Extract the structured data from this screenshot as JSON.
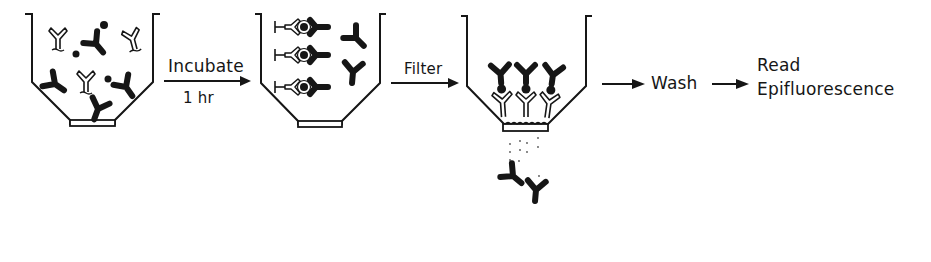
{
  "diagram": {
    "type": "process-flow",
    "colors": {
      "ink": "#161616",
      "background": "#ffffff"
    },
    "steps": [
      {
        "id": "funnel-1",
        "label": "",
        "contents": "free unlabeled antibodies, labeled antibodies, antigen particles"
      },
      {
        "id": "arrow-incubate",
        "label_top": "Incubate",
        "label_bottom": "1 hr"
      },
      {
        "id": "funnel-2",
        "label": "",
        "contents": "antigen-antibody sandwich complexes plus free labeled antibodies"
      },
      {
        "id": "arrow-filter",
        "label_top": "Filter"
      },
      {
        "id": "funnel-3",
        "label": "",
        "contents": "complexes retained on filter, free labeled antibodies passing through"
      },
      {
        "id": "arrow-wash",
        "label": "Wash"
      },
      {
        "id": "arrow-read",
        "label_line1": "Read",
        "label_line2": "Epifluorescence"
      }
    ]
  },
  "labels": {
    "incubate": "Incubate",
    "incubate_time": "1 hr",
    "filter": "Filter",
    "wash": "Wash",
    "read_line1": "Read",
    "read_line2": "Epifluorescence"
  }
}
